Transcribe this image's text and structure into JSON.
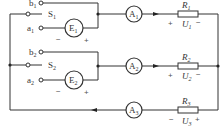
{
  "diagram": {
    "type": "circuit",
    "terminals": [
      {
        "id": "b1",
        "label": "b",
        "sub": "1"
      },
      {
        "id": "a1",
        "label": "a",
        "sub": "1"
      },
      {
        "id": "b2",
        "label": "b",
        "sub": "2"
      },
      {
        "id": "a2",
        "label": "a",
        "sub": "2"
      }
    ],
    "switches": [
      {
        "id": "S1",
        "label": "S",
        "sub": "1"
      },
      {
        "id": "S2",
        "label": "S",
        "sub": "2"
      }
    ],
    "sources": [
      {
        "id": "E1",
        "label": "E",
        "sub": "1",
        "minus": "−",
        "plus": "+"
      },
      {
        "id": "E2",
        "label": "E",
        "sub": "2",
        "minus": "−",
        "plus": "+"
      }
    ],
    "ammeters": [
      {
        "id": "A1",
        "label": "A",
        "sub": "1"
      },
      {
        "id": "A2",
        "label": "A",
        "sub": "2"
      },
      {
        "id": "A3",
        "label": "A",
        "sub": "3"
      }
    ],
    "resistors": [
      {
        "id": "R1",
        "label": "R",
        "sub": "1",
        "voltage": "U",
        "vsub": "1",
        "left_sign": "+",
        "right_sign": "−"
      },
      {
        "id": "R2",
        "label": "R",
        "sub": "2",
        "voltage": "U",
        "vsub": "2",
        "left_sign": "+",
        "right_sign": "−"
      },
      {
        "id": "R3",
        "label": "R",
        "sub": "3",
        "voltage": "U",
        "vsub": "3",
        "left_sign": "−",
        "right_sign": "+"
      }
    ]
  }
}
